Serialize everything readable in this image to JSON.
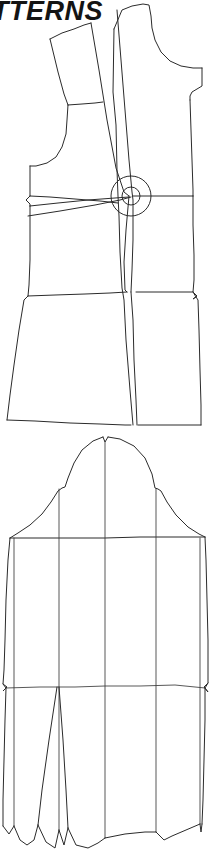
{
  "page": {
    "background_color": "#ffffff",
    "line_color": "#2b2b2b",
    "width": 212,
    "height": 857
  },
  "heading": {
    "text": "ATTERNS",
    "full_word_implied": "PATTERNS",
    "style": "italic-bold-sans",
    "cropped_at_left": true,
    "color": "#141414"
  },
  "figures": [
    {
      "id": "bodice-front-pivot",
      "name": "Bodice front with pivot darts",
      "type": "flat-pattern-line-drawing",
      "elements": [
        "shoulder-dart-leg-left",
        "shoulder-dart-leg-right",
        "center-front-line",
        "armhole-curve-left",
        "armhole-curve-right",
        "waist-line",
        "hem-line",
        "side-seam-left",
        "side-seam-right",
        "pivot-point-circles",
        "underarm-dart-leg-upper",
        "underarm-dart-leg-lower"
      ],
      "pivot_point": {
        "x": 131,
        "y": 196,
        "radii": [
          9,
          20
        ]
      }
    },
    {
      "id": "sleeve-slash-spread",
      "name": "Sleeve with slash-and-spread lines",
      "type": "flat-pattern-line-drawing",
      "elements": [
        "sleeve-cap-curve",
        "cap-notch-top",
        "biceps-line",
        "elbow-line",
        "slash-line-1",
        "slash-line-2",
        "slash-line-3",
        "slash-line-4",
        "slash-line-5",
        "underarm-seam-left",
        "underarm-seam-right",
        "hem-scallops",
        "center-dart"
      ],
      "cap_apex": {
        "x": 105,
        "y": 437
      },
      "biceps_line_y": 538,
      "elbow_line_y": 686,
      "hem_y": 845
    }
  ]
}
